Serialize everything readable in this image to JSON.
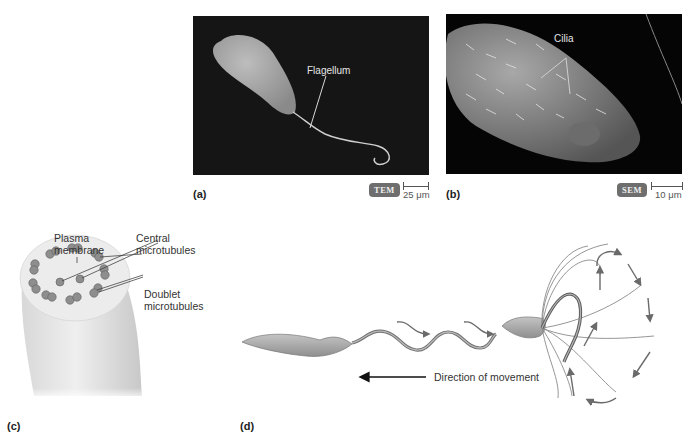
{
  "figure": {
    "panels": [
      {
        "id": "a",
        "letter": "(a)",
        "type": "micrograph",
        "label": "Flagellum",
        "imaging_mode": "TEM",
        "scale_bar": "25 μm"
      },
      {
        "id": "b",
        "letter": "(b)",
        "type": "micrograph",
        "label": "Cilia",
        "imaging_mode": "SEM",
        "scale_bar": "10 μm"
      },
      {
        "id": "c",
        "letter": "(c)",
        "type": "illustration",
        "labels": {
          "plasma_membrane_1": "Plasma",
          "plasma_membrane_2": "membrane",
          "central_1": "Central",
          "central_2": "microtubules",
          "doublet_1": "Doublet",
          "doublet_2": "microtubules"
        }
      },
      {
        "id": "d",
        "letter": "(d)",
        "type": "illustration",
        "direction_label": "Direction of movement"
      }
    ]
  },
  "colors": {
    "cell_fill": "#a7a7a7",
    "cell_stroke": "#6f6f6f",
    "arrow_gray": "#6a6a6a",
    "micrograph_bg": "#0a0a0a",
    "badge": "#6e6e6e"
  }
}
